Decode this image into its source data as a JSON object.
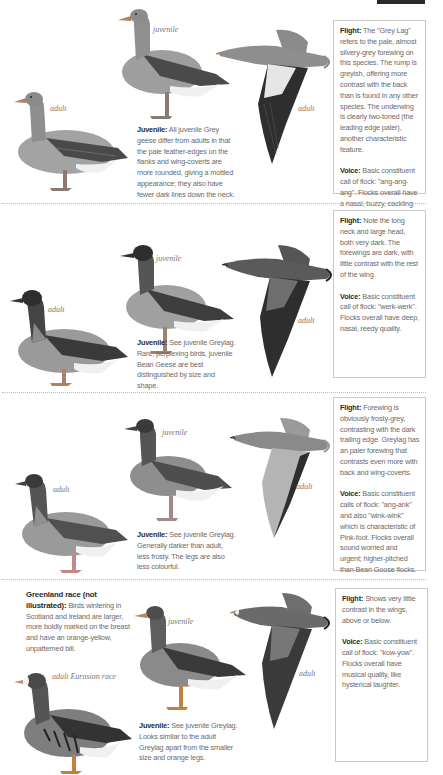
{
  "page": {
    "header_bar_color": "#2a2a2a"
  },
  "sections": [
    {
      "id": "greylag",
      "labels": {
        "adult_standing": "adult",
        "juvenile": "juvenile",
        "adult_flight": "adult"
      },
      "juvenile": {
        "label": "Juvenile:",
        "text": " All juvenile Grey geese differ from adults in that the pale feather-edges on the flanks and wing-coverts are more rounded, giving a mottled appearance; they also have fewer dark lines down the neck."
      },
      "flight": {
        "label": "Flight:",
        "text": " The \"Grey Lag\" refers to the pale, almost silvery-grey forewing on this species. The rump is greyish, offering more contrast with the back than is found in any other species. The underwing is clearly two-toned (the leading edge paler), another characteristic feature."
      },
      "voice": {
        "label": "Voice:",
        "text": " Basic constituent call of flock: \"ang-ang-ang\". Flocks overall have a nasal, buzzy, cackling quality."
      },
      "colors": {
        "body": "#9a9a9a",
        "wing": "#4a4a4a",
        "head": "#8e8e8e"
      }
    },
    {
      "id": "bean",
      "labels": {
        "adult_standing": "adult",
        "juvenile": "juvenile",
        "adult_flight": "adult"
      },
      "juvenile": {
        "label": "Juvenile:",
        "text": " See juvenile Greylag. Rare, perplexing birds, juvenile Bean Geese are best distinguished by size and shape."
      },
      "flight": {
        "label": "Flight:",
        "text": " Note the long neck and large head, both very dark. The forewings are dark, with little contrast with the rest of the wing."
      },
      "voice": {
        "label": "Voice:",
        "text": " Basic constituent call of flock: \"werk-werk\". Flocks overall have deep, nasal, reedy quality."
      },
      "colors": {
        "body": "#8c8c8c",
        "wing": "#3a3a3a",
        "head": "#2e2e2e"
      }
    },
    {
      "id": "pinkfoot",
      "labels": {
        "adult_standing": "adult",
        "juvenile": "juvenile",
        "adult_flight": "adult"
      },
      "juvenile": {
        "label": "Juvenile:",
        "text": " See juvenile Greylag. Generally darker than adult, less frosty. The legs are also less colourful."
      },
      "flight": {
        "label": "Flight:",
        "text": " Forewing is obviously frosty-grey, contrasting with the dark trailing edge. Greylag has an paler forewing that contrasts even more with back and wing-coverts."
      },
      "voice": {
        "label": "Voice:",
        "text": " Basic constituent calls of flock: \"ang-ank\" and also \"wink-wink\" which is characteristic of Pink-foot. Flocks overall sound worried and urgent; higher-pitched than Bean Goose flocks."
      },
      "colors": {
        "body": "#959595",
        "wing": "#505050",
        "head": "#3a3a3a"
      }
    },
    {
      "id": "whitefront",
      "labels": {
        "adult_standing": "adult Eurasian race",
        "juvenile": "juvenile",
        "adult_flight": "adult"
      },
      "greenland": {
        "label": "Greenland race (not illustrated):",
        "text": " Birds wintering in Scotland and Ireland are larger, more boldly marked on the breast and have an orange-yellow, unpatterned bill."
      },
      "juvenile": {
        "label": "Juvenile:",
        "text": " See juvenile Greylag. Looks similar to the adult Greylag apart from the smaller size and orange legs."
      },
      "flight": {
        "label": "Flight:",
        "text": " Shows very little contrast in the wings, above or below."
      },
      "voice": {
        "label": "Voice:",
        "text": " Basic constituent call of flock: \"kow-yow\". Flocks overall have musical quality, like hysterical laughter."
      },
      "colors": {
        "body": "#7e7e7e",
        "wing": "#333333",
        "head": "#4a4a4a"
      }
    }
  ]
}
